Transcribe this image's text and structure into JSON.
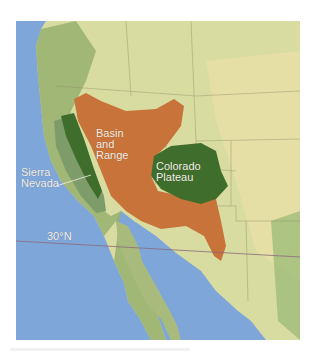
{
  "map": {
    "title": "Western North America physiographic provinces",
    "colors": {
      "ocean": "#7fa6d8",
      "land_low": "#e9e2a8",
      "land_mid": "#cfd89a",
      "land_mountain": "#8fae6a",
      "basin_and_range": "#c8733a",
      "plateau_and_sierra": "#3f6e2c",
      "sierra_light": "#7e9c6a",
      "latitude_line": "#8a6a7a",
      "label_text": "#f4efe6"
    },
    "regions": [
      {
        "id": "basin-and-range",
        "label": "Basin\nand\nRange"
      },
      {
        "id": "colorado-plateau",
        "label": "Colorado\nPlateau"
      },
      {
        "id": "sierra-nevada",
        "label": "Sierra\nNevada"
      }
    ],
    "latitude": {
      "label": "30°N"
    }
  }
}
